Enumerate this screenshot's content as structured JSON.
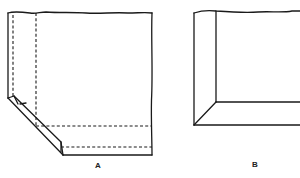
{
  "figure": {
    "panels": [
      {
        "id": "A",
        "label": "A",
        "description": "Sheet with mitered corner fold, dashed fold lines"
      },
      {
        "id": "B",
        "label": "B",
        "description": "Folded corner showing mitered edge"
      }
    ],
    "colors": {
      "line": "#1a1a1a",
      "background": "#ffffff"
    }
  }
}
